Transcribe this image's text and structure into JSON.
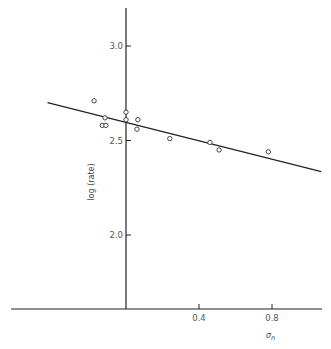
{
  "chart_data": {
    "type": "scatter",
    "title": "",
    "xlabel": "σn",
    "ylabel": "log (rate)",
    "xlim": [
      -0.63,
      1.1
    ],
    "ylim": [
      1.6,
      3.2
    ],
    "x_ticks": [
      0.4,
      0.8
    ],
    "x_tick_labels": [
      "0.4",
      "0.8"
    ],
    "y_ticks": [
      2.0,
      2.5,
      3.0
    ],
    "y_tick_labels": [
      "2.0",
      "2.5",
      "3.0"
    ],
    "grid": false,
    "legend": null,
    "series": [
      {
        "name": "observed",
        "marker": "open-circle",
        "points": [
          {
            "x": -0.175,
            "y": 2.71
          },
          {
            "x": -0.115,
            "y": 2.62
          },
          {
            "x": -0.13,
            "y": 2.58
          },
          {
            "x": -0.11,
            "y": 2.58
          },
          {
            "x": 0.0,
            "y": 2.65
          },
          {
            "x": 0.0,
            "y": 2.61
          },
          {
            "x": 0.065,
            "y": 2.61
          },
          {
            "x": 0.06,
            "y": 2.56
          },
          {
            "x": 0.24,
            "y": 2.51
          },
          {
            "x": 0.46,
            "y": 2.49
          },
          {
            "x": 0.51,
            "y": 2.45
          },
          {
            "x": 0.78,
            "y": 2.44
          }
        ]
      },
      {
        "name": "fitted line",
        "type": "line",
        "points": [
          {
            "x": -0.43,
            "y": 2.7
          },
          {
            "x": 1.07,
            "y": 2.335
          }
        ]
      }
    ]
  },
  "layout": {
    "origin_px": [
      126,
      309
    ],
    "x_px_per_unit": 182.5,
    "y_ref_px": 46,
    "y_ref_value": 3.0,
    "y_px_per_unit": 189,
    "x_axis_px": [
      11,
      322
    ],
    "y_axis_px": [
      8,
      309
    ]
  },
  "labels": {
    "xlabel": "σ",
    "xlabel_sub": "n",
    "ylabel": "log (rate)"
  },
  "colors": {
    "axis": "#222222",
    "line": "#222222",
    "marker": "#333333",
    "text": "#555555"
  }
}
